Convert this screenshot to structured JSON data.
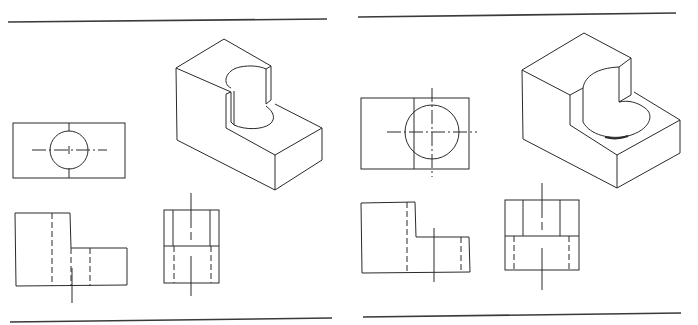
{
  "figure": {
    "type": "orthographic-projection-exercise",
    "panels": [
      {
        "id": "left",
        "description": "Block with vertical through-hole cut into step; isometric view with top, front and side orthographic views",
        "views": [
          "top-view",
          "isometric-view",
          "front-view",
          "side-view"
        ],
        "line_color": "#2a2a2a"
      },
      {
        "id": "right",
        "description": "Block with larger counterbored vertical hole in step; isometric view with top, front and side orthographic views",
        "views": [
          "top-view",
          "isometric-view",
          "front-view",
          "side-view"
        ],
        "line_color": "#2a2a2a"
      }
    ]
  }
}
